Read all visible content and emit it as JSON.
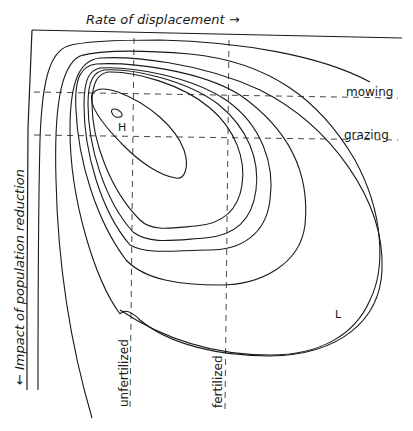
{
  "diagram": {
    "x_axis_label": "Rate of displacement →",
    "y_axis_label": "← Impact of population reduction",
    "horizontal_reference_lines": [
      {
        "label": "mowing"
      },
      {
        "label": "grazing"
      }
    ],
    "vertical_reference_lines": [
      {
        "label": "unfertilized"
      },
      {
        "label": "fertilized"
      }
    ],
    "peak_label": "H",
    "low_label": "L",
    "contour_count": 8
  },
  "colors": {
    "line": "#1a1a1a",
    "background": "#ffffff"
  }
}
